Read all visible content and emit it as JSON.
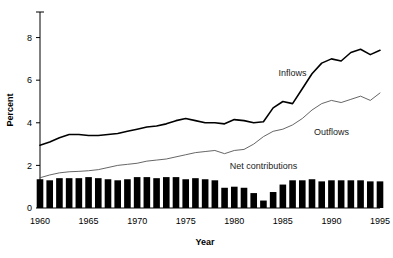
{
  "chart_data": {
    "type": "line",
    "title": "",
    "xlabel": "Year",
    "ylabel": "Percent",
    "xlim": [
      1960,
      1995
    ],
    "ylim": [
      0,
      9.2
    ],
    "yticks": [
      0,
      2,
      4,
      6,
      8
    ],
    "ytick_labels": [
      "0",
      "2",
      "4",
      "6",
      "8"
    ],
    "xticks": [
      1960,
      1965,
      1970,
      1975,
      1980,
      1985,
      1990,
      1995
    ],
    "xtick_labels": [
      "1960",
      "1965",
      "1970",
      "1975",
      "1980",
      "1985",
      "1990",
      "1995"
    ],
    "grid": false,
    "legend_position": "inline-annotations",
    "x": [
      1960,
      1961,
      1962,
      1963,
      1964,
      1965,
      1966,
      1967,
      1968,
      1969,
      1970,
      1971,
      1972,
      1973,
      1974,
      1975,
      1976,
      1977,
      1978,
      1979,
      1980,
      1981,
      1982,
      1983,
      1984,
      1985,
      1986,
      1987,
      1988,
      1989,
      1990,
      1991,
      1992,
      1993,
      1994,
      1995
    ],
    "series": [
      {
        "name": "Inflows",
        "style": "solid-thick-black",
        "color": "#000000",
        "values": [
          2.95,
          3.1,
          3.3,
          3.45,
          3.45,
          3.4,
          3.4,
          3.45,
          3.5,
          3.6,
          3.7,
          3.8,
          3.85,
          3.95,
          4.1,
          4.2,
          4.1,
          4.0,
          4.0,
          3.95,
          4.15,
          4.1,
          4.0,
          4.05,
          4.7,
          5.0,
          4.9,
          5.6,
          6.3,
          6.8,
          7.0,
          6.9,
          7.3,
          7.45,
          7.2,
          7.4
        ]
      },
      {
        "name": "Outflows",
        "style": "solid-thin-gray",
        "color": "#555555",
        "values": [
          1.42,
          1.55,
          1.65,
          1.7,
          1.72,
          1.75,
          1.8,
          1.9,
          2.0,
          2.05,
          2.1,
          2.2,
          2.25,
          2.3,
          2.4,
          2.5,
          2.6,
          2.65,
          2.7,
          2.55,
          2.7,
          2.75,
          3.0,
          3.35,
          3.6,
          3.7,
          3.9,
          4.2,
          4.6,
          4.9,
          5.05,
          4.95,
          5.1,
          5.25,
          5.05,
          5.4
        ]
      },
      {
        "name": "Net contributions",
        "style": "bars-black",
        "color": "#000000",
        "values": [
          1.35,
          1.3,
          1.4,
          1.4,
          1.4,
          1.45,
          1.4,
          1.35,
          1.3,
          1.35,
          1.45,
          1.45,
          1.4,
          1.45,
          1.45,
          1.35,
          1.4,
          1.35,
          1.3,
          0.95,
          1.0,
          0.95,
          0.7,
          0.35,
          0.75,
          1.1,
          1.3,
          1.3,
          1.35,
          1.25,
          1.3,
          1.3,
          1.3,
          1.3,
          1.25,
          1.25
        ]
      }
    ],
    "annotations": [
      {
        "text": "Inflows",
        "x": 1986,
        "y": 6.2
      },
      {
        "text": "Outflows",
        "x": 1990,
        "y": 3.45
      },
      {
        "text": "Net contributions",
        "x": 1983,
        "y": 1.85
      }
    ]
  }
}
